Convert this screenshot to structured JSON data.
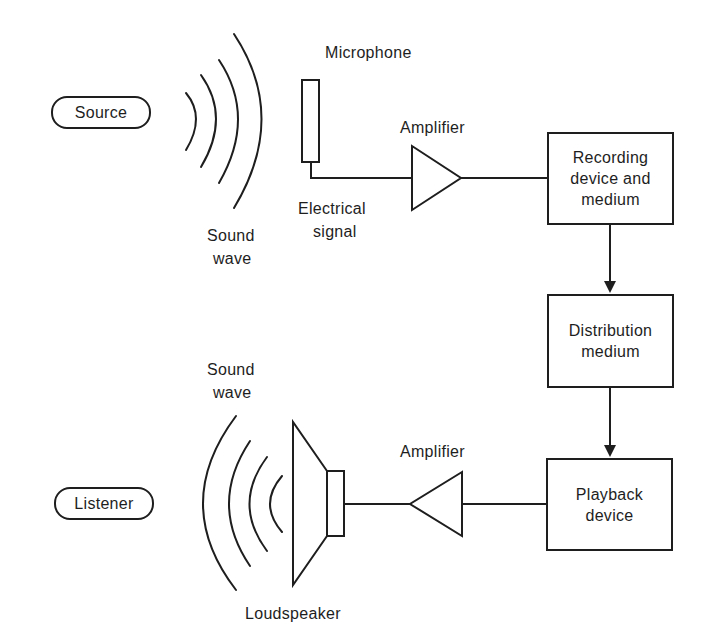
{
  "diagram": {
    "colors": {
      "stroke": "#1e1e1e",
      "background": "#ffffff",
      "text": "#1e1e1e"
    },
    "nodes": {
      "source": {
        "label": "Source",
        "shape": "pill"
      },
      "listener": {
        "label": "Listener",
        "shape": "pill"
      },
      "recording": {
        "label": "Recording\ndevice and\nmedium",
        "shape": "box"
      },
      "distribution": {
        "label": "Distribution\nmedium",
        "shape": "box"
      },
      "playback": {
        "label": "Playback\ndevice",
        "shape": "box"
      }
    },
    "labels": {
      "microphone": "Microphone",
      "amplifier_top": "Amplifier",
      "electrical_signal_1": "Electrical",
      "electrical_signal_2": "signal",
      "sound_wave_top_1": "Sound",
      "sound_wave_top_2": "wave",
      "sound_wave_bottom_1": "Sound",
      "sound_wave_bottom_2": "wave",
      "amplifier_bottom": "Amplifier",
      "loudspeaker": "Loudspeaker"
    },
    "icons": {
      "sound_wave_out": "sound-wave-arcs-right",
      "microphone": "microphone-rect",
      "amplifier_forward": "triangle-right",
      "amplifier_reverse": "triangle-left",
      "loudspeaker": "loudspeaker-cone",
      "sound_wave_in": "sound-wave-arcs-left"
    },
    "edges": [
      {
        "from": "microphone",
        "to": "amplifier_top",
        "type": "line"
      },
      {
        "from": "amplifier_top",
        "to": "recording",
        "type": "line"
      },
      {
        "from": "recording",
        "to": "distribution",
        "type": "arrow"
      },
      {
        "from": "distribution",
        "to": "playback",
        "type": "arrow"
      },
      {
        "from": "playback",
        "to": "amplifier_bottom",
        "type": "line"
      },
      {
        "from": "amplifier_bottom",
        "to": "loudspeaker",
        "type": "line"
      }
    ]
  }
}
